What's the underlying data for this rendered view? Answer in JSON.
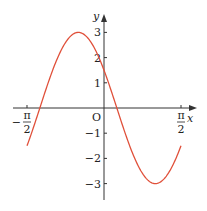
{
  "chart_data": {
    "type": "line",
    "title": "",
    "function": "y = 3 sin(2x + 5π/6)",
    "xlabel": "x",
    "ylabel": "y",
    "origin_label": "O",
    "x_ticks": [
      {
        "value": -1.5708,
        "label_top": "π",
        "label_bottom": "2",
        "sign": "−"
      },
      {
        "value": 1.5708,
        "label_top": "π",
        "label_bottom": "2",
        "sign": ""
      }
    ],
    "y_ticks": [
      {
        "value": 3,
        "label": "3"
      },
      {
        "value": 2,
        "label": "2"
      },
      {
        "value": 1,
        "label": "1"
      },
      {
        "value": -1,
        "label": "−1"
      },
      {
        "value": -2,
        "label": "−2"
      },
      {
        "value": -3,
        "label": "−3"
      }
    ],
    "xlim": [
      -1.5708,
      1.5708
    ],
    "ylim": [
      -3,
      3
    ],
    "key_points": [
      {
        "x": -1.5708,
        "y": -1.5
      },
      {
        "x": -1.309,
        "y": 0
      },
      {
        "x": -0.5236,
        "y": 3
      },
      {
        "x": 0,
        "y": 1.5
      },
      {
        "x": 0.2618,
        "y": 0
      },
      {
        "x": 1.0472,
        "y": -3
      },
      {
        "x": 1.5708,
        "y": -1.5
      }
    ],
    "curve_color": "#e0503a",
    "axis_color": "#333333",
    "grid": false
  }
}
